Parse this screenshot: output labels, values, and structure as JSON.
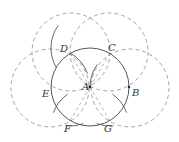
{
  "diagram": {
    "title": "",
    "center": {
      "label": "A",
      "x": 90,
      "y": 87
    },
    "main_circle": {
      "cx": 90,
      "cy": 87,
      "r": 39,
      "style": "solid"
    },
    "points": [
      {
        "label": "B",
        "x": 129,
        "y": 87,
        "lx": 132,
        "ly": 96
      },
      {
        "label": "C",
        "x": 110,
        "y": 53,
        "lx": 108,
        "ly": 51
      },
      {
        "label": "D",
        "x": 70,
        "y": 53,
        "lx": 60,
        "ly": 52
      },
      {
        "label": "E",
        "x": 51,
        "y": 90,
        "lx": 42,
        "ly": 97
      },
      {
        "label": "F",
        "x": 70,
        "y": 121,
        "lx": 64,
        "ly": 132
      },
      {
        "label": "G",
        "x": 110,
        "y": 121,
        "lx": 104,
        "ly": 132
      }
    ],
    "dashed_circles": [
      {
        "name": "circle-centered-D",
        "cx": 71,
        "cy": 52,
        "r": 39
      },
      {
        "name": "circle-centered-C",
        "cx": 109,
        "cy": 52,
        "r": 39
      },
      {
        "name": "circle-centered-E",
        "cx": 50,
        "cy": 88,
        "r": 39
      },
      {
        "name": "circle-centered-B",
        "cx": 130,
        "cy": 88,
        "r": 39
      }
    ],
    "colors": {
      "solid": "#555555",
      "dashed": "#9a9a9a",
      "label": "#333333"
    }
  }
}
